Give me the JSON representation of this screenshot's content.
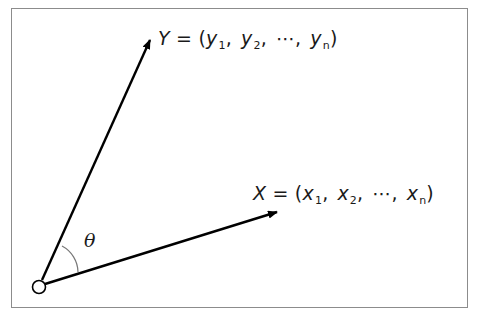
{
  "diagram": {
    "type": "vector-angle",
    "vectors": [
      {
        "name": "Y",
        "components": [
          "y",
          "y",
          "⋯",
          "y"
        ],
        "subscripts": [
          "1",
          "2",
          "",
          "n"
        ],
        "label_prefix": "Y",
        "equals": "=",
        "open_paren": "(",
        "close_paren": ")",
        "separator": ","
      },
      {
        "name": "X",
        "components": [
          "x",
          "x",
          "⋯",
          "x"
        ],
        "subscripts": [
          "1",
          "2",
          "",
          "n"
        ],
        "label_prefix": "X",
        "equals": "=",
        "open_paren": "(",
        "close_paren": ")",
        "separator": ","
      }
    ],
    "angle_label": "θ",
    "origin_marker": "circle",
    "colors": {
      "frame": "#8c8c8c",
      "stroke": "#000000",
      "arc": "#777777",
      "text": "#1a1a1a"
    }
  }
}
